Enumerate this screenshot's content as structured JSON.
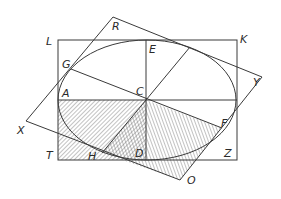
{
  "diagram": {
    "type": "geometric-construction",
    "colors": {
      "line": "#3a3a3a",
      "hatch": "#555555",
      "background": "#ffffff"
    },
    "points": {
      "L": [
        58,
        40
      ],
      "K": [
        237,
        40
      ],
      "Z": [
        237,
        160
      ],
      "T": [
        58,
        160
      ],
      "E": [
        146,
        40
      ],
      "A": [
        58,
        100
      ],
      "C": [
        146,
        100
      ],
      "D": [
        146,
        160
      ],
      "R": [
        113,
        17
      ],
      "Y": [
        262,
        77
      ],
      "O": [
        180,
        180
      ],
      "X": [
        26,
        121
      ],
      "G": [
        71,
        69
      ],
      "F": [
        222,
        128
      ],
      "H": [
        102,
        153
      ],
      "P": [
        190,
        47
      ]
    },
    "ellipse": {
      "cx": 147,
      "cy": 100,
      "rx": 89,
      "ry": 60
    },
    "labels": {
      "L": "L",
      "R": "R",
      "E": "E",
      "K": "K",
      "G": "G",
      "Y": "Y",
      "A": "A",
      "C": "C",
      "X": "X",
      "F": "F",
      "T": "T",
      "H": "H",
      "D": "D",
      "Z": "Z",
      "O": "O"
    },
    "hatched_regions": [
      {
        "name": "rectangle-quadrant",
        "vertices": [
          "A",
          "C",
          "D",
          "T"
        ]
      },
      {
        "name": "parallelogram-quadrant",
        "vertices": [
          "C",
          "F",
          "O",
          "H"
        ]
      }
    ]
  }
}
